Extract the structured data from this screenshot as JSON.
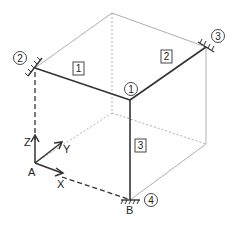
{
  "diagram": {
    "type": "3D frame structure",
    "members": [
      {
        "id": "1",
        "label": "1",
        "from": "node-2",
        "to": "node-1"
      },
      {
        "id": "2",
        "label": "2",
        "from": "node-1",
        "to": "node-3"
      },
      {
        "id": "3",
        "label": "3",
        "from": "node-1",
        "to": "node-4"
      }
    ],
    "nodes": [
      {
        "id": "node-1",
        "label": "1",
        "support": "none"
      },
      {
        "id": "node-2",
        "label": "2",
        "support": "fixed"
      },
      {
        "id": "node-3",
        "label": "3",
        "support": "fixed"
      },
      {
        "id": "node-4",
        "label": "4",
        "support": "fixed"
      }
    ],
    "points": {
      "A": "A",
      "B": "B"
    },
    "axes": {
      "x": "X",
      "y": "Y",
      "z": "Z"
    },
    "colors": {
      "member": "#333333",
      "guide": "#999999",
      "dash": "#333333"
    }
  }
}
